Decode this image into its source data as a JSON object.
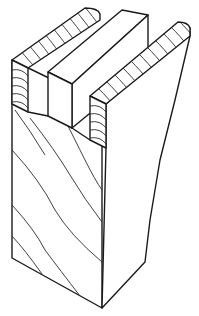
{
  "figure": {
    "stroke_color": "#1a1a1a",
    "background": "#ffffff"
  }
}
